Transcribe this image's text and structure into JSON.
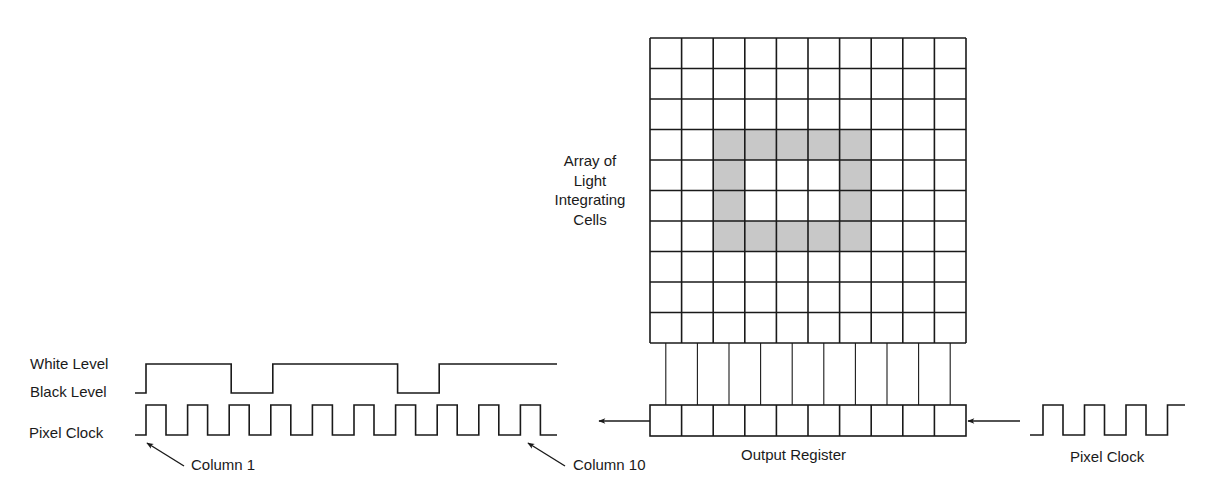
{
  "labels": {
    "array": [
      "Array of",
      "Light",
      "Integrating",
      "Cells"
    ],
    "white_level": "White Level",
    "black_level": "Black Level",
    "pixel_clock_left": "Pixel Clock",
    "column_1": "Column 1",
    "column_10": "Column 10",
    "output_register": "Output Register",
    "pixel_clock_right": "Pixel Clock"
  },
  "colors": {
    "line": "#1a1a1a",
    "shade": "#c8c8c8",
    "background": "#ffffff"
  },
  "array": {
    "rows": 10,
    "cols": 10,
    "x": 650,
    "y": 38,
    "width": 316,
    "height": 305,
    "shaded_cells": [
      [
        3,
        2
      ],
      [
        3,
        3
      ],
      [
        3,
        4
      ],
      [
        3,
        5
      ],
      [
        3,
        6
      ],
      [
        4,
        2
      ],
      [
        4,
        6
      ],
      [
        5,
        2
      ],
      [
        5,
        6
      ],
      [
        6,
        2
      ],
      [
        6,
        3
      ],
      [
        6,
        4
      ],
      [
        6,
        5
      ],
      [
        6,
        6
      ]
    ]
  },
  "output_register": {
    "cells": 10,
    "x": 650,
    "y": 405,
    "width": 316,
    "height": 31
  },
  "video_signal": {
    "levels": [
      "black",
      "white",
      "white",
      "white",
      "black",
      "white",
      "white",
      "white",
      "black",
      "white",
      "white"
    ],
    "description": "White level with two black dips (columns 3 and 7)"
  },
  "pixel_clock": {
    "left_pulses": 10,
    "right_pulses": 4
  }
}
